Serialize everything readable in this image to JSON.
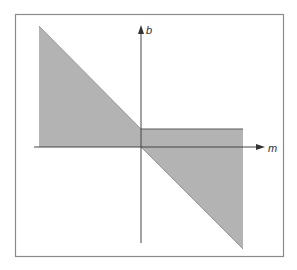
{
  "diagram": {
    "type": "shaded region in m-b parameter plane",
    "axes": {
      "horizontal": {
        "label": "m"
      },
      "vertical": {
        "label": "b"
      }
    },
    "colors": {
      "background": "#ffffff",
      "frame": "#8a8a8a",
      "axis": "#444444",
      "region_fill": "#b3b3b3",
      "region_edge": "#8c8c8c"
    },
    "regions": [
      {
        "name": "upper-left triangle",
        "description": "Region bounded by m<0, b>=0 under a line of negative slope"
      },
      {
        "name": "strip above m-axis",
        "description": "Rectangle for m>0 between b=0 and a small positive b"
      },
      {
        "name": "lower-right triangle",
        "description": "Region for m>0 between b=0 and a line of negative slope"
      }
    ]
  }
}
